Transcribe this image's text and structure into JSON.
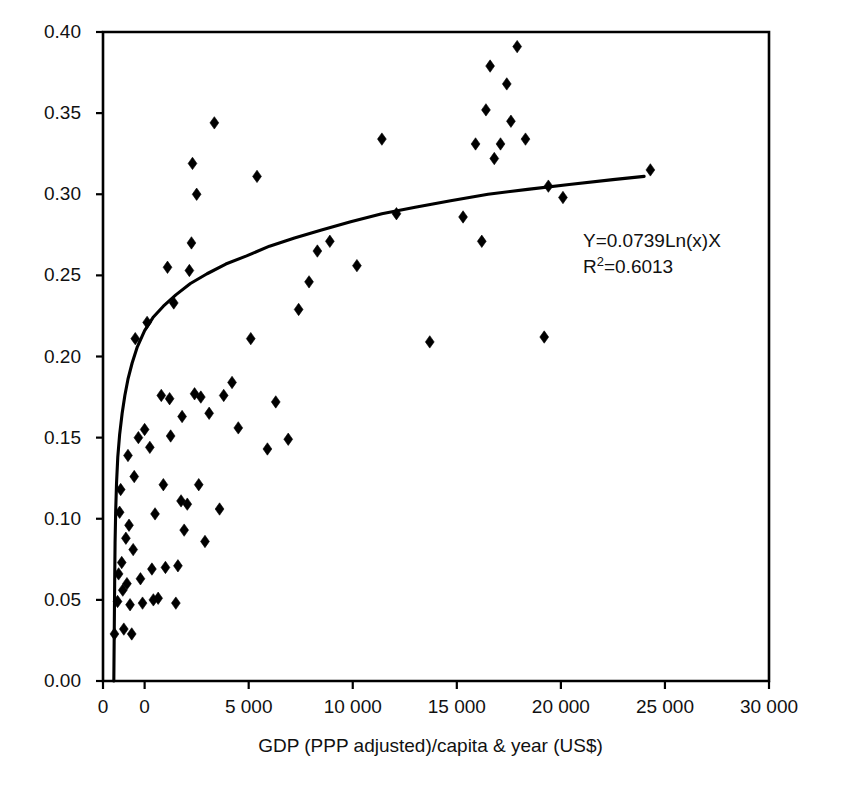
{
  "chart_data": {
    "type": "scatter",
    "title": "",
    "subtitle": "",
    "xlabel": "GDP (PPP adjusted)/capita & year (US$)",
    "ylabel": "",
    "xlim": [
      -2000,
      30000
    ],
    "ylim": [
      0.0,
      0.4
    ],
    "grid": false,
    "legend": null,
    "xticks": [
      {
        "value": -2000,
        "label": "0"
      },
      {
        "value": 0,
        "label": "0"
      },
      {
        "value": 5000,
        "label": "5 000"
      },
      {
        "value": 10000,
        "label": "10 000"
      },
      {
        "value": 15000,
        "label": "15 000"
      },
      {
        "value": 20000,
        "label": "20 000"
      },
      {
        "value": 25000,
        "label": "25 000"
      },
      {
        "value": 30000,
        "label": "30 000"
      }
    ],
    "yticks": [
      {
        "value": 0.0,
        "label": "0.00"
      },
      {
        "value": 0.05,
        "label": "0.05"
      },
      {
        "value": 0.1,
        "label": "0.10"
      },
      {
        "value": 0.15,
        "label": "0.15"
      },
      {
        "value": 0.2,
        "label": "0.20"
      },
      {
        "value": 0.25,
        "label": "0.25"
      },
      {
        "value": 0.3,
        "label": "0.30"
      },
      {
        "value": 0.35,
        "label": "0.35"
      },
      {
        "value": 0.4,
        "label": "0.40"
      }
    ],
    "annotations": [
      {
        "name": "regression-equation",
        "text": "Y=0.0739Ln(x)X",
        "x": 16700,
        "y": 0.272
      },
      {
        "name": "r-squared",
        "text_prefix": "R",
        "text_sup": "2",
        "text_suffix": "=0.6013",
        "text": "R2=0.6013",
        "x": 16700,
        "y": 0.256
      }
    ],
    "series": [
      {
        "name": "observations",
        "marker": "diamond",
        "color": "#000000",
        "points": [
          [
            -1450,
            0.029
          ],
          [
            -1300,
            0.049
          ],
          [
            -1250,
            0.066
          ],
          [
            -1200,
            0.104
          ],
          [
            -1150,
            0.118
          ],
          [
            -1100,
            0.073
          ],
          [
            -1050,
            0.056
          ],
          [
            -1000,
            0.032
          ],
          [
            -900,
            0.088
          ],
          [
            -850,
            0.06
          ],
          [
            -800,
            0.139
          ],
          [
            -750,
            0.096
          ],
          [
            -700,
            0.047
          ],
          [
            -620,
            0.029
          ],
          [
            -550,
            0.081
          ],
          [
            -500,
            0.126
          ],
          [
            -450,
            0.211
          ],
          [
            -300,
            0.15
          ],
          [
            -200,
            0.063
          ],
          [
            -100,
            0.048
          ],
          [
            0,
            0.155
          ],
          [
            120,
            0.221
          ],
          [
            250,
            0.144
          ],
          [
            350,
            0.069
          ],
          [
            420,
            0.05
          ],
          [
            500,
            0.103
          ],
          [
            650,
            0.051
          ],
          [
            800,
            0.176
          ],
          [
            900,
            0.121
          ],
          [
            1000,
            0.07
          ],
          [
            1100,
            0.255
          ],
          [
            1200,
            0.174
          ],
          [
            1250,
            0.151
          ],
          [
            1400,
            0.233
          ],
          [
            1500,
            0.048
          ],
          [
            1600,
            0.071
          ],
          [
            1750,
            0.111
          ],
          [
            1800,
            0.163
          ],
          [
            1900,
            0.093
          ],
          [
            2050,
            0.109
          ],
          [
            2150,
            0.253
          ],
          [
            2250,
            0.27
          ],
          [
            2300,
            0.319
          ],
          [
            2400,
            0.177
          ],
          [
            2500,
            0.3
          ],
          [
            2600,
            0.121
          ],
          [
            2700,
            0.175
          ],
          [
            2900,
            0.086
          ],
          [
            3100,
            0.165
          ],
          [
            3350,
            0.344
          ],
          [
            3600,
            0.106
          ],
          [
            3800,
            0.176
          ],
          [
            4200,
            0.184
          ],
          [
            4500,
            0.156
          ],
          [
            5100,
            0.211
          ],
          [
            5400,
            0.311
          ],
          [
            5900,
            0.143
          ],
          [
            6300,
            0.172
          ],
          [
            6900,
            0.149
          ],
          [
            7400,
            0.229
          ],
          [
            7900,
            0.246
          ],
          [
            8300,
            0.265
          ],
          [
            8900,
            0.271
          ],
          [
            10200,
            0.256
          ],
          [
            11400,
            0.334
          ],
          [
            12100,
            0.288
          ],
          [
            13700,
            0.209
          ],
          [
            15300,
            0.286
          ],
          [
            15900,
            0.331
          ],
          [
            16200,
            0.271
          ],
          [
            16400,
            0.352
          ],
          [
            16600,
            0.379
          ],
          [
            16800,
            0.322
          ],
          [
            17100,
            0.331
          ],
          [
            17400,
            0.368
          ],
          [
            17600,
            0.345
          ],
          [
            17900,
            0.391
          ],
          [
            18300,
            0.334
          ],
          [
            19200,
            0.212
          ],
          [
            19400,
            0.305
          ],
          [
            20100,
            0.298
          ],
          [
            24300,
            0.315
          ]
        ]
      }
    ],
    "trendline": {
      "name": "logarithmic-fit",
      "equation": "Y=0.0739Ln(x)X",
      "r_squared": "0.6013",
      "coefficient": 0.0739,
      "color": "#000000",
      "points": [
        [
          -1480,
          0.0
        ],
        [
          -1460,
          0.03
        ],
        [
          -1440,
          0.06
        ],
        [
          -1420,
          0.085
        ],
        [
          -1390,
          0.105
        ],
        [
          -1350,
          0.122
        ],
        [
          -1290,
          0.138
        ],
        [
          -1200,
          0.152
        ],
        [
          -1080,
          0.165
        ],
        [
          -950,
          0.176
        ],
        [
          -800,
          0.186
        ],
        [
          -600,
          0.196
        ],
        [
          -350,
          0.206
        ],
        [
          0,
          0.216
        ],
        [
          400,
          0.224
        ],
        [
          900,
          0.231
        ],
        [
          1500,
          0.238
        ],
        [
          2200,
          0.245
        ],
        [
          3000,
          0.251
        ],
        [
          3900,
          0.257
        ],
        [
          4900,
          0.262
        ],
        [
          6000,
          0.268
        ],
        [
          7200,
          0.273
        ],
        [
          8500,
          0.278
        ],
        [
          9900,
          0.283
        ],
        [
          11400,
          0.288
        ],
        [
          13000,
          0.292
        ],
        [
          14700,
          0.296
        ],
        [
          16500,
          0.3
        ],
        [
          18400,
          0.303
        ],
        [
          20400,
          0.306
        ],
        [
          22500,
          0.309
        ],
        [
          24000,
          0.311
        ]
      ]
    }
  }
}
